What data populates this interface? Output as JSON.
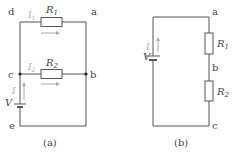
{
  "circuit_a": {
    "caption": "(a)",
    "nodes": {
      "a": "a",
      "b": "b",
      "c": "c",
      "d": "d",
      "e": "e"
    },
    "resistors": [
      {
        "name": "R",
        "sub": "1"
      },
      {
        "name": "R",
        "sub": "2"
      }
    ],
    "currents": [
      {
        "name": "I",
        "sub": "1"
      },
      {
        "name": "I",
        "sub": "2"
      },
      {
        "name": "I",
        "sub": ""
      }
    ],
    "source": "V"
  },
  "circuit_b": {
    "caption": "(b)",
    "nodes": {
      "a": "a",
      "b": "b",
      "c": "c"
    },
    "resistors": [
      {
        "name": "R",
        "sub": "1"
      },
      {
        "name": "R",
        "sub": "2"
      }
    ],
    "current": "I",
    "source": "V"
  },
  "colors": {
    "wire": "#555555",
    "current_arrow": "#aaaaaa",
    "text": "#444444"
  }
}
